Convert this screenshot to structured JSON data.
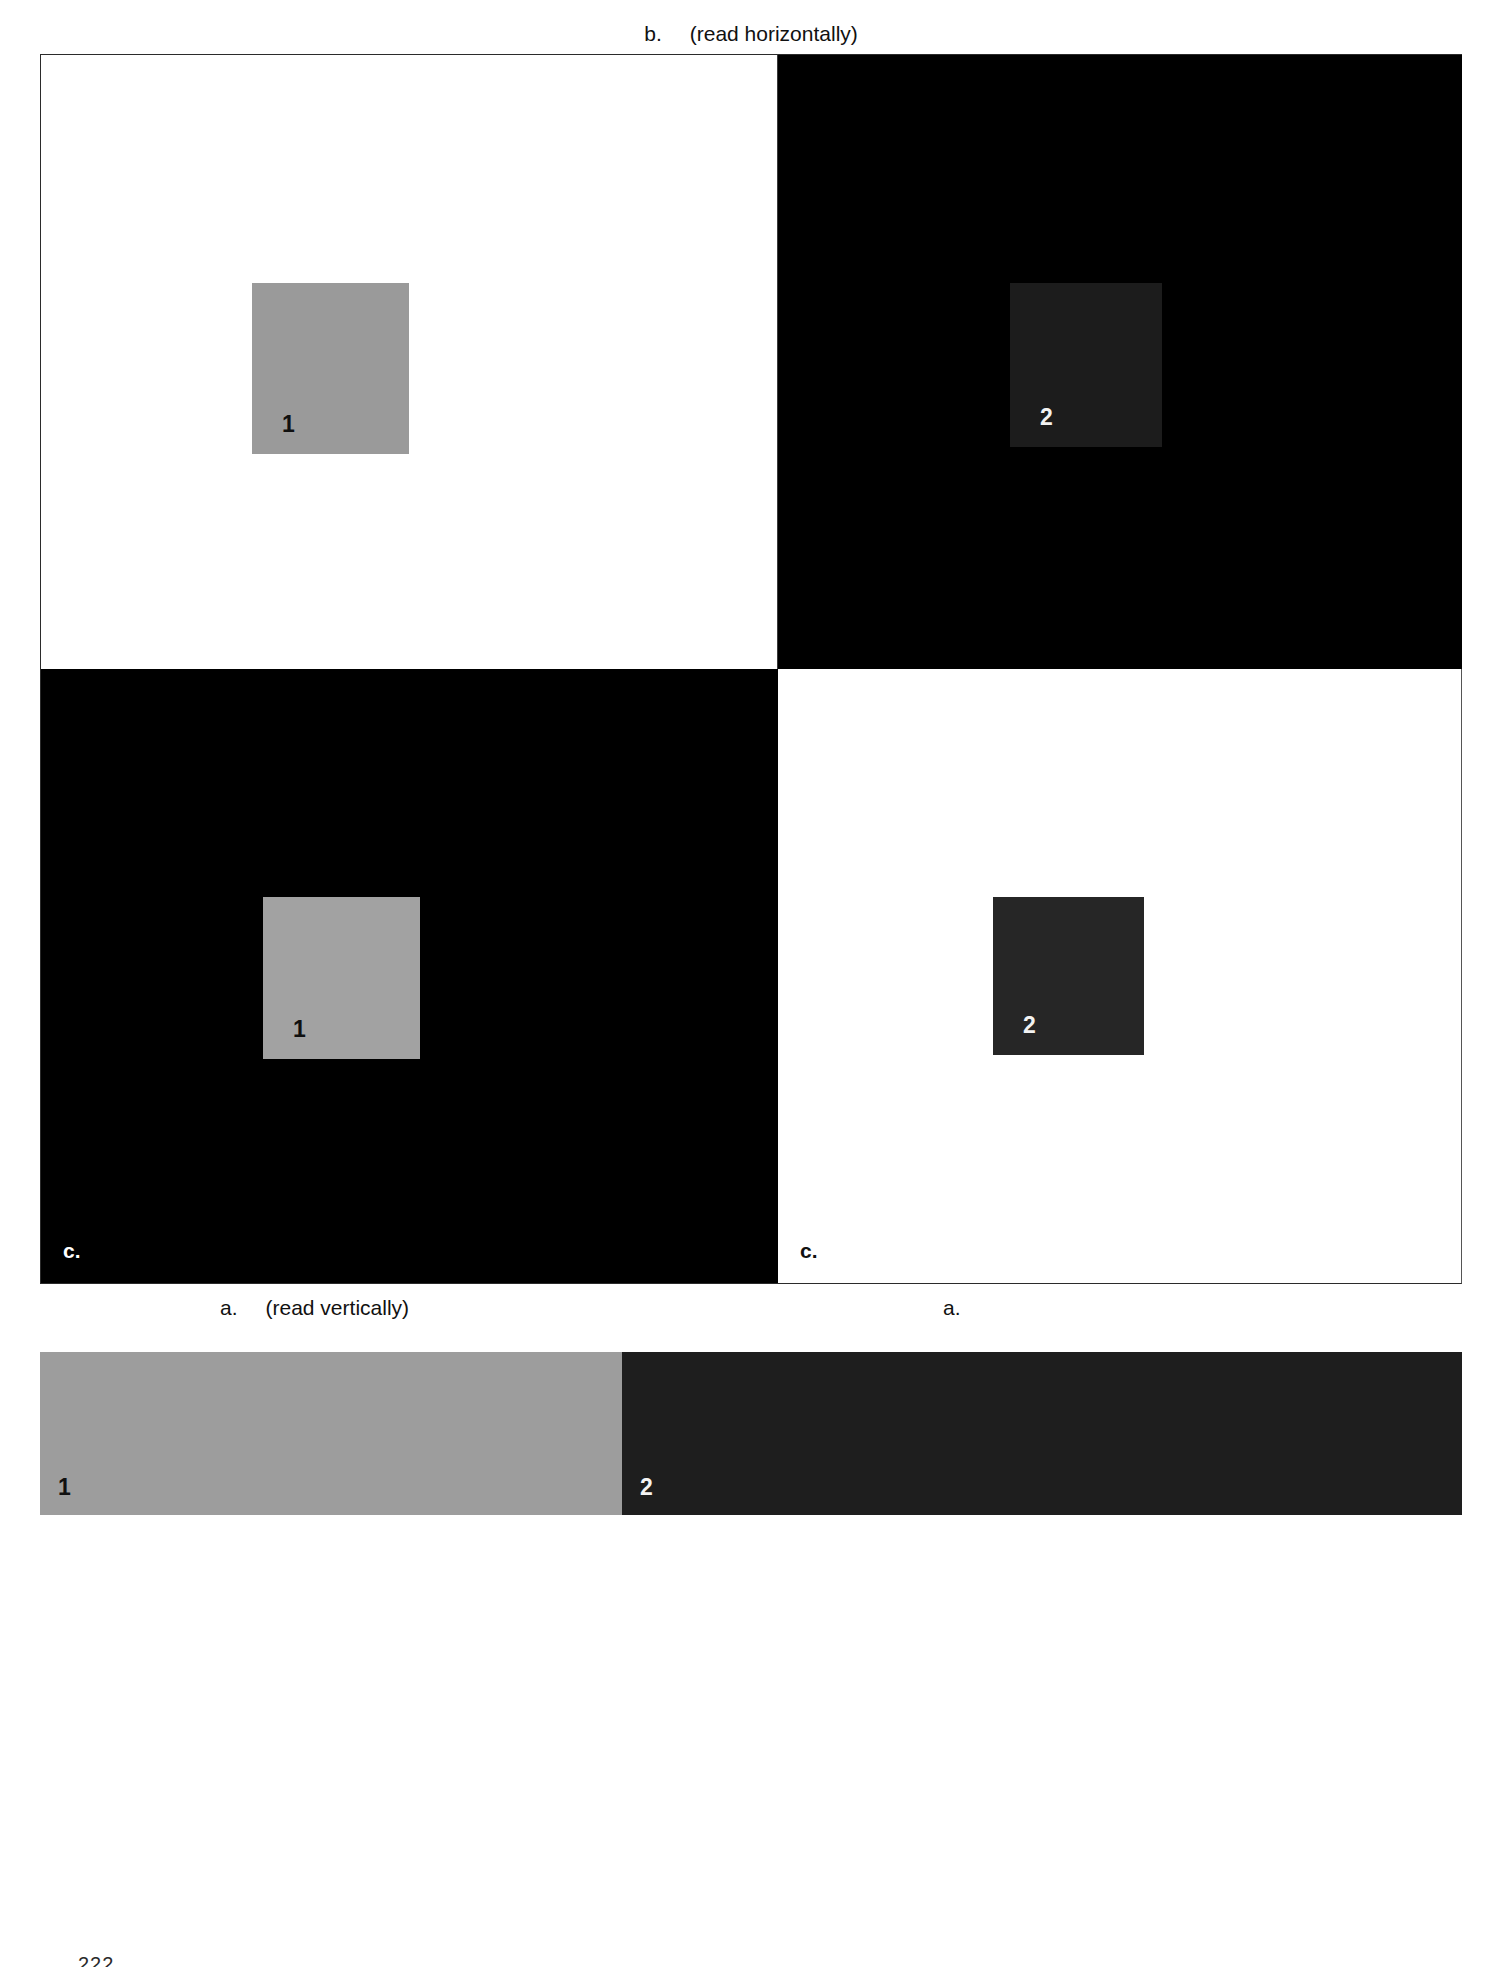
{
  "figure": {
    "top_caption": {
      "letter": "b.",
      "text": "(read horizontally)"
    },
    "bottom_caption_left": {
      "letter": "a.",
      "text": "(read vertically)"
    },
    "bottom_caption_right": {
      "letter": "a.",
      "text": ""
    },
    "folio": "222"
  },
  "panels": [
    {
      "id": "panel-a",
      "position": "top-left",
      "background": "light",
      "background_color": "#ffffff",
      "swatch_label": "1",
      "swatch_color": "#9a9a9a",
      "swatch_label_color": "#101010",
      "corner_label": ""
    },
    {
      "id": "panel-b",
      "position": "top-right",
      "background": "dark",
      "background_color": "#000000",
      "swatch_label": "2",
      "swatch_color": "#1c1c1c",
      "swatch_label_color": "#f2f2f2",
      "corner_label": ""
    },
    {
      "id": "panel-c",
      "position": "bottom-left",
      "background": "dark",
      "background_color": "#000000",
      "swatch_label": "1",
      "swatch_color": "#a2a2a2",
      "swatch_label_color": "#101010",
      "corner_label": "c."
    },
    {
      "id": "panel-d",
      "position": "bottom-right",
      "background": "light",
      "background_color": "#ffffff",
      "swatch_label": "2",
      "swatch_color": "#262626",
      "swatch_label_color": "#f2f2f2",
      "corner_label": "c."
    }
  ],
  "strip": {
    "left": {
      "label": "1",
      "color": "#9d9d9d",
      "label_color": "#101010"
    },
    "right": {
      "label": "2",
      "color": "#1e1e1e",
      "label_color": "#f4f4f4"
    }
  }
}
